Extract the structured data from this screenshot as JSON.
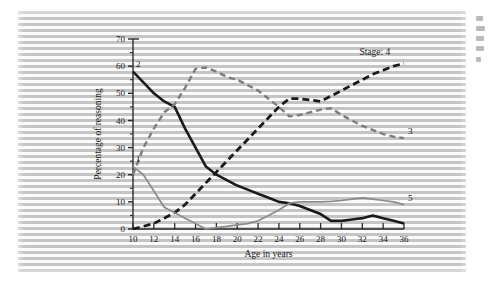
{
  "figure": {
    "caption_present": false,
    "background_note": "striped scanned halftone panel"
  },
  "chart_data": {
    "type": "line",
    "title": "",
    "subtitle": "",
    "xlabel": "Age in years",
    "ylabel": "Percentage of reasoning",
    "xlim": [
      10,
      36
    ],
    "ylim": [
      0,
      70
    ],
    "xticks": [
      10,
      12,
      14,
      16,
      18,
      20,
      22,
      24,
      26,
      28,
      30,
      32,
      34,
      36
    ],
    "xtick_labels": [
      "10",
      "12",
      "14",
      "16",
      "18",
      "20",
      "22",
      "24",
      "26",
      "28",
      "30",
      "32",
      "34",
      "36"
    ],
    "yticks": [
      0,
      10,
      20,
      30,
      40,
      50,
      60,
      70
    ],
    "ytick_labels": [
      "0",
      "10",
      "20",
      "30",
      "40",
      "50",
      "60",
      "70"
    ],
    "y_minor_tick_step": 5,
    "grid": false,
    "legend_position": "inline-end-of-line",
    "annotations": [
      {
        "name": "stage-annotation",
        "text": "Stage: 4",
        "x": 33.2,
        "y": 64
      }
    ],
    "series": [
      {
        "name": "2",
        "label": "2",
        "label_position": "start-top",
        "style": "solid",
        "color": "#1a1a1a",
        "width": 2.6,
        "x": [
          10,
          11,
          12,
          13,
          14,
          15,
          16,
          17,
          18,
          19,
          20,
          21,
          22,
          23,
          24,
          25,
          26,
          27,
          28,
          29,
          30,
          31,
          32,
          33,
          34,
          35,
          36
        ],
        "values": [
          58,
          54,
          50,
          47,
          45,
          37,
          30,
          23,
          20,
          18,
          16,
          14.5,
          13,
          11.5,
          10,
          9.5,
          8.5,
          7,
          5.5,
          3,
          3,
          3.5,
          4,
          5,
          4,
          3,
          2
        ]
      },
      {
        "name": "3",
        "label": "3",
        "label_position": "end-top",
        "style": "dashed",
        "color": "#7d7d7d",
        "width": 2.4,
        "x": [
          10,
          11,
          12,
          13,
          14,
          15,
          16,
          17,
          18,
          19,
          20,
          21,
          22,
          23,
          24,
          25,
          26,
          27,
          28,
          29,
          30,
          31,
          32,
          33,
          34,
          35,
          36
        ],
        "values": [
          20,
          30,
          37,
          43,
          46,
          52,
          59,
          59.5,
          58,
          56,
          55,
          53,
          51,
          48,
          45,
          41.5,
          42,
          43,
          44,
          44.5,
          42,
          40,
          38,
          36.5,
          35,
          34,
          33.5
        ]
      },
      {
        "name": "4",
        "label": "4",
        "label_position": "annotation",
        "style": "dashed",
        "color": "#1a1a1a",
        "width": 2.8,
        "x": [
          10,
          11,
          12,
          13,
          14,
          15,
          16,
          17,
          18,
          19,
          20,
          21,
          22,
          23,
          24,
          25,
          26,
          27,
          28,
          29,
          30,
          31,
          32,
          33,
          34,
          35,
          36
        ],
        "values": [
          0,
          1,
          2,
          4,
          6,
          9,
          13,
          17,
          21,
          25,
          29,
          33,
          37,
          41,
          45,
          48,
          48,
          47.5,
          47,
          49,
          51,
          53,
          55,
          57,
          58.5,
          60,
          61
        ]
      },
      {
        "name": "1",
        "label": "1",
        "label_position": "start-top",
        "style": "solid",
        "color": "#8c8c8c",
        "width": 1.7,
        "x": [
          10,
          11,
          12,
          13,
          14,
          15,
          16,
          17
        ],
        "values": [
          23,
          20,
          14,
          8,
          6,
          4,
          2,
          0
        ]
      },
      {
        "name": "5",
        "label": "5",
        "label_position": "end-top",
        "style": "solid",
        "color": "#8c8c8c",
        "width": 1.7,
        "x": [
          17,
          18,
          19,
          20,
          21,
          22,
          23,
          24,
          25,
          26,
          27,
          28,
          29,
          30,
          31,
          32,
          33,
          34,
          35,
          36
        ],
        "values": [
          0,
          0.5,
          1,
          1.5,
          2,
          3,
          5,
          7,
          9.5,
          10,
          10,
          10,
          10.2,
          10.5,
          11,
          11.5,
          11,
          10.5,
          10,
          9
        ]
      }
    ]
  },
  "edge_bleed": {
    "description": "faint partial glyph fragments from facing page column",
    "fragment_count": 5
  }
}
